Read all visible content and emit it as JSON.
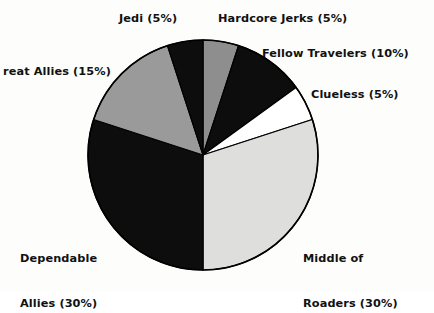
{
  "chart_data": {
    "type": "pie",
    "title": "",
    "subtitle": "",
    "xlabel": "",
    "ylabel": "",
    "grid": false,
    "legend_position": "none",
    "label_format": "{name} ({value}%)",
    "start_angle_deg": 0,
    "direction": "clockwise",
    "center": {
      "x": 203,
      "y": 155
    },
    "radius": 115,
    "total": 100,
    "categories": [
      "Hardcore Jerks",
      "Fellow Travelers",
      "Clueless",
      "Middle of Roaders",
      "Dependable Allies",
      "Great Allies",
      "Jedi"
    ],
    "values": [
      5,
      10,
      5,
      30,
      30,
      15,
      5
    ],
    "colors": [
      "#8e8e8e",
      "#0d0d0d",
      "#ffffff",
      "#dededc",
      "#0d0d0d",
      "#9a9a9a",
      "#0d0d0d"
    ],
    "slices": [
      {
        "name": "Hardcore Jerks",
        "value": 5,
        "color": "#8e8e8e",
        "label": "Hardcore Jerks (5%)"
      },
      {
        "name": "Fellow Travelers",
        "value": 10,
        "color": "#0d0d0d",
        "label": "Fellow Travelers (10%)"
      },
      {
        "name": "Clueless",
        "value": 5,
        "color": "#ffffff",
        "label": "Clueless (5%)"
      },
      {
        "name": "Middle of Roaders",
        "value": 30,
        "color": "#dededc",
        "label": "Middle of\nRoaders (30%)"
      },
      {
        "name": "Dependable Allies",
        "value": 30,
        "color": "#0d0d0d",
        "label": "Dependable\nAllies (30%)"
      },
      {
        "name": "Great Allies",
        "value": 15,
        "color": "#9a9a9a",
        "label": "reat Allies (15%)"
      },
      {
        "name": "Jedi",
        "value": 5,
        "color": "#0d0d0d",
        "label": "Jedi (5%)"
      }
    ],
    "stroke_color": "#000000",
    "background": "#fdfdfc"
  },
  "labels": {
    "jedi": "Jedi (5%)",
    "hardcore_jerks": "Hardcore Jerks (5%)",
    "fellow_travelers": "Fellow Travelers (10%)",
    "clueless": "Clueless (5%)",
    "great_allies": "reat Allies (15%)",
    "middle_of_roaders_line1": "Middle of",
    "middle_of_roaders_line2": "Roaders (30%)",
    "dependable_allies_line1": "Dependable",
    "dependable_allies_line2": "Allies (30%)"
  }
}
